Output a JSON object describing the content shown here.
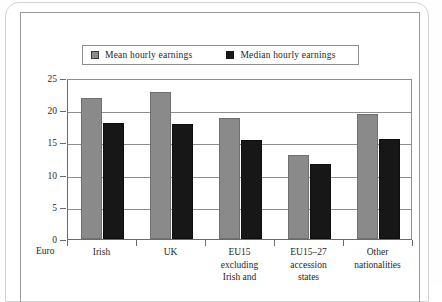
{
  "figure": {
    "axis_unit_label": "Euro"
  },
  "chart_data": {
    "type": "bar",
    "title": "",
    "xlabel": "",
    "ylabel": "Euro",
    "ylim": [
      0,
      25
    ],
    "yticks": [
      0,
      5,
      10,
      15,
      20,
      25
    ],
    "ytick_labels": [
      "0",
      "5",
      "10",
      "15",
      "20",
      "25"
    ],
    "grid": true,
    "legend_position": "top",
    "categories": [
      "Irish",
      "UK",
      "EU15 excluding Irish and",
      "EU15–27 accession states",
      "Other nationalities"
    ],
    "category_lines": [
      [
        "Irish"
      ],
      [
        "UK"
      ],
      [
        "EU15",
        "excluding",
        "Irish and"
      ],
      [
        "EU15–27",
        "accession",
        "states"
      ],
      [
        "Other",
        "nationalities"
      ]
    ],
    "series": [
      {
        "name": "Mean hourly earnings",
        "color": "#8a8a8a",
        "values": [
          21.9,
          22.9,
          18.8,
          13.0,
          19.4
        ]
      },
      {
        "name": "Median hourly earnings",
        "color": "#171717",
        "values": [
          18.0,
          17.8,
          15.4,
          11.6,
          15.5
        ]
      }
    ]
  }
}
